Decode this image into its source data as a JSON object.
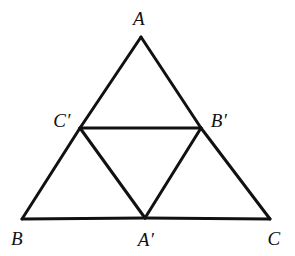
{
  "figure": {
    "kind": "geometry-diagram",
    "background_color": "#ffffff",
    "stroke_color": "#111111",
    "stroke_width": 3,
    "canvas": {
      "width": 295,
      "height": 256
    }
  },
  "labels": {
    "a": "A",
    "b": "B",
    "c": "C",
    "a_prime": "A′",
    "b_prime": "B′",
    "c_prime": "C′"
  },
  "chart_data": {
    "type": "diagram",
    "title": "",
    "points": [
      {
        "name": "A",
        "x": 141,
        "y": 37,
        "label": "A",
        "label_x": 139,
        "label_y": 18
      },
      {
        "name": "B",
        "x": 22,
        "y": 219,
        "label": "B",
        "label_x": 17,
        "label_y": 238
      },
      {
        "name": "C",
        "x": 270,
        "y": 219,
        "label": "C",
        "label_x": 274,
        "label_y": 238
      },
      {
        "name": "A'",
        "x": 145,
        "y": 218,
        "label": "A′",
        "label_x": 146,
        "label_y": 239
      },
      {
        "name": "B'",
        "x": 201,
        "y": 128,
        "label": "B′",
        "label_x": 219,
        "label_y": 120
      },
      {
        "name": "C'",
        "x": 80,
        "y": 128,
        "label": "C′",
        "label_x": 62,
        "label_y": 120
      }
    ],
    "segments": [
      {
        "from": "A",
        "to": "C'"
      },
      {
        "from": "C'",
        "to": "B"
      },
      {
        "from": "A",
        "to": "B'"
      },
      {
        "from": "B'",
        "to": "C"
      },
      {
        "from": "B",
        "to": "A'"
      },
      {
        "from": "A'",
        "to": "C"
      },
      {
        "from": "C'",
        "to": "B'"
      },
      {
        "from": "C'",
        "to": "A'"
      },
      {
        "from": "A'",
        "to": "B'"
      }
    ]
  }
}
